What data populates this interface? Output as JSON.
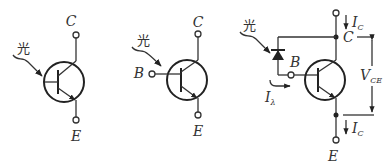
{
  "figure": {
    "circuits": [
      {
        "id": "phototransistor-2-terminal",
        "light_label": "光",
        "terminals": {
          "collector": "C",
          "emitter": "E"
        }
      },
      {
        "id": "phototransistor-3-terminal",
        "light_label": "光",
        "terminals": {
          "base": "B",
          "collector": "C",
          "emitter": "E"
        }
      },
      {
        "id": "phototransistor-equivalent",
        "light_label": "光",
        "terminals": {
          "base": "B",
          "collector": "C",
          "emitter": "E"
        },
        "currents": {
          "collector_top": {
            "main": "I",
            "sub": "C"
          },
          "collector_bottom": {
            "main": "I",
            "sub": "C"
          },
          "photo": {
            "main": "I",
            "sub": "λ"
          }
        },
        "voltage": {
          "main": "V",
          "sub": "CE"
        }
      }
    ]
  }
}
